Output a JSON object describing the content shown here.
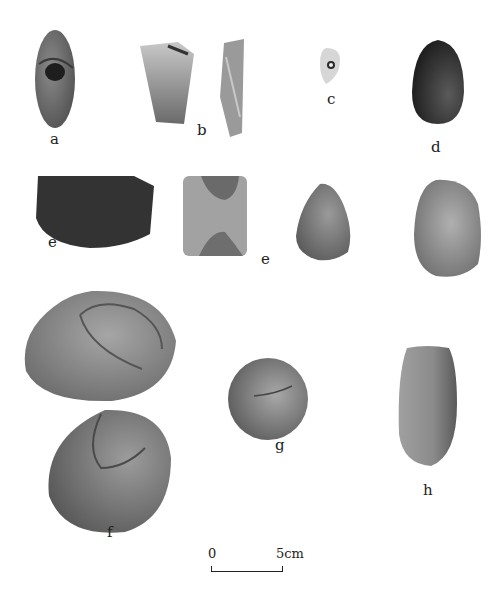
{
  "plate": {
    "background": "#ffffff",
    "artifacts": [
      {
        "id": "a",
        "label": "a",
        "description": "perforated stone pendant, elongated oval with drilled hole",
        "tone": "#6e6e6e"
      },
      {
        "id": "b",
        "label": "b",
        "description": "stone blade fragment, two views (face and side)",
        "tone": "#9a9a9a"
      },
      {
        "id": "c",
        "label": "c",
        "description": "small perforated stone bead",
        "tone": "#d4d4d4"
      },
      {
        "id": "d",
        "label": "d",
        "description": "polished dark egg-shaped stone",
        "tone": "#2e2e2e"
      },
      {
        "id": "e1",
        "label": "e",
        "description": "dark polished stone adze/axe",
        "tone": "#333333"
      },
      {
        "id": "e2",
        "label": "e",
        "description": "rectangular stone chisel with chipped ends",
        "tone": "#9c9c9c"
      },
      {
        "id": "e3",
        "label": "",
        "description": "conical pebble tool",
        "tone": "#7e7e7e"
      },
      {
        "id": "e4",
        "label": "",
        "description": "oval pebble tool",
        "tone": "#9a9a9a"
      },
      {
        "id": "f1",
        "label": "",
        "description": "large flat oval grinding pebble",
        "tone": "#8a8a8a"
      },
      {
        "id": "f2",
        "label": "f",
        "description": "rounded grinding pebble",
        "tone": "#7a7a7a"
      },
      {
        "id": "g",
        "label": "g",
        "description": "spherical hammer stone",
        "tone": "#7c7c7c"
      },
      {
        "id": "h",
        "label": "h",
        "description": "elongated pestle stone",
        "tone": "#8c8c8c"
      }
    ],
    "scale": {
      "start": "0",
      "end": "5cm"
    }
  }
}
